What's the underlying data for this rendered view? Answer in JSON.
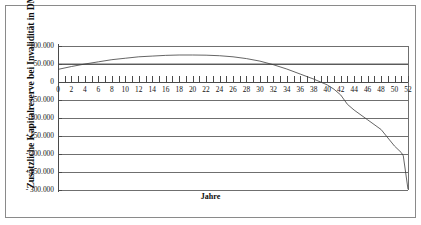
{
  "chart_data": {
    "type": "line",
    "title": "",
    "xlabel": "Jahre",
    "ylabel": "Zusätzliche Kapitalreserve bei Invalidität in DM",
    "xlim": [
      0,
      52
    ],
    "ylim": [
      -300000,
      100000
    ],
    "grid": true,
    "legend": "none",
    "x_tick_labels": [
      "0",
      "2",
      "4",
      "6",
      "8",
      "10",
      "12",
      "14",
      "16",
      "18",
      "20",
      "22",
      "24",
      "26",
      "28",
      "30",
      "32",
      "34",
      "36",
      "38",
      "40",
      "42",
      "44",
      "46",
      "48",
      "50",
      "52"
    ],
    "x_tick_values": [
      0,
      2,
      4,
      6,
      8,
      10,
      12,
      14,
      16,
      18,
      20,
      22,
      24,
      26,
      28,
      30,
      32,
      34,
      36,
      38,
      40,
      42,
      44,
      46,
      48,
      50,
      52
    ],
    "x_minor_tick_step": 1,
    "y_tick_labels": [
      "100.000",
      "50.000",
      "0",
      "- 50.000",
      "- 100.000",
      "- 150.000",
      "- 200.000",
      "- 250.000",
      "- 300.000"
    ],
    "y_tick_values": [
      100000,
      50000,
      0,
      -50000,
      -100000,
      -150000,
      -200000,
      -250000,
      -300000
    ],
    "series": [
      {
        "name": "Kapitalreserve",
        "color": "#3d3d3d",
        "x": [
          0,
          2,
          4,
          6,
          8,
          10,
          12,
          14,
          16,
          18,
          20,
          22,
          24,
          26,
          28,
          30,
          32,
          34,
          36,
          38,
          40,
          41,
          42,
          43,
          44,
          46,
          48,
          50,
          51,
          51.3,
          52
        ],
        "values": [
          35000,
          43000,
          50000,
          56000,
          62000,
          66000,
          70000,
          72000,
          74000,
          75000,
          75000,
          74500,
          73000,
          70000,
          65000,
          58000,
          48000,
          36000,
          22000,
          8000,
          -8000,
          -20000,
          -36000,
          -62000,
          -78000,
          -105000,
          -132000,
          -178000,
          -196000,
          -205000,
          -298000
        ]
      },
      {
        "name": "Referenzniveau",
        "color": "#3d3d3d",
        "x": [
          0,
          52
        ],
        "values": [
          50000,
          50000
        ]
      }
    ]
  },
  "axes": {
    "y_title": "Zusätzliche Kapitalreserve bei Invalidität in DM",
    "x_title": "Jahre"
  }
}
